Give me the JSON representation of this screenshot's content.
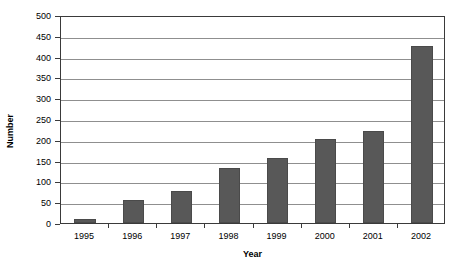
{
  "chart_data": {
    "type": "bar",
    "title": "",
    "xlabel": "Year",
    "ylabel": "Number",
    "categories": [
      "1995",
      "1996",
      "1997",
      "1998",
      "1999",
      "2000",
      "2001",
      "2002"
    ],
    "values": [
      10,
      55,
      78,
      132,
      157,
      203,
      220,
      425
    ],
    "ylim": [
      0,
      500
    ],
    "ytick_step": 50,
    "yticks": [
      "500",
      "450",
      "400",
      "350",
      "300",
      "250",
      "200",
      "150",
      "100",
      "50",
      "0"
    ],
    "ytick_values": [
      500,
      450,
      400,
      350,
      300,
      250,
      200,
      150,
      100,
      50,
      0
    ],
    "grid": "horizontal",
    "legend": "none",
    "bar_color": "#585858",
    "gridline_color": "#8f8f8f",
    "axis_color": "#3a3a3a",
    "background_color": "#ffffff"
  }
}
